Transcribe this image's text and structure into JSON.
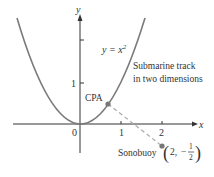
{
  "diagram": {
    "curve_label": "y = x",
    "curve_label_exp": "2",
    "curve_description_line1": "Submarine track",
    "curve_description_line2": "in two dimensions",
    "point_cpa_label": "CPA",
    "point_sonobuoy_label": "Sonobuoy",
    "sonobuoy_coord_x": "2,",
    "sonobuoy_coord_minus": "−",
    "sonobuoy_frac_num": "1",
    "sonobuoy_frac_den": "2",
    "axis_x_label": "x",
    "axis_y_label": "y",
    "tick_origin": "0",
    "x_ticks": [
      "1",
      "2"
    ],
    "y_ticks": [
      "1"
    ],
    "colors": {
      "curve": "#7a7a7a",
      "axis": "#333333",
      "point": "#777777",
      "dashed": "#aaaaaa"
    }
  }
}
